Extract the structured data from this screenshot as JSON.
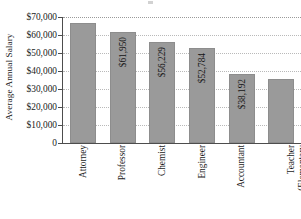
{
  "chart_data": {
    "type": "bar",
    "title": "",
    "subtitle": "",
    "xlabel": "",
    "ylabel": "Average Annual Salary",
    "categories": [
      "Attorney",
      "Professor",
      "Chemist",
      "Engineer",
      "Accountant",
      "Teacher (Elementary and Secondary)"
    ],
    "category_lines": [
      [
        "Attorney"
      ],
      [
        "Professor"
      ],
      [
        "Chemist"
      ],
      [
        "Engineer"
      ],
      [
        "Accountant"
      ],
      [
        "Teacher",
        "(Elementary",
        "and Secondary)"
      ]
    ],
    "values": [
      66500,
      61950,
      56229,
      52784,
      38192,
      35500
    ],
    "data_labels": [
      "",
      "$61,950",
      "$56,229",
      "$52,784",
      "$38,192",
      ""
    ],
    "ylim": [
      0,
      70000
    ],
    "ytick_values": [
      0,
      10000,
      20000,
      30000,
      40000,
      50000,
      60000,
      70000
    ],
    "ytick_labels": [
      "0",
      "$10,000",
      "$20,000",
      "$30,000",
      "$40,000",
      "$50,000",
      "$60,000",
      "$70,000"
    ],
    "grid": true,
    "grid_axis": "y",
    "legend": false,
    "legend_position": "none",
    "bar_color": "#9a9a9a",
    "bar_border_color": "#8d8d8d",
    "gridline_color": "#b9b9b9",
    "axis_color": "#4d4d4d",
    "text_color": "#1a1a1a",
    "background_color": "#ffffff"
  }
}
